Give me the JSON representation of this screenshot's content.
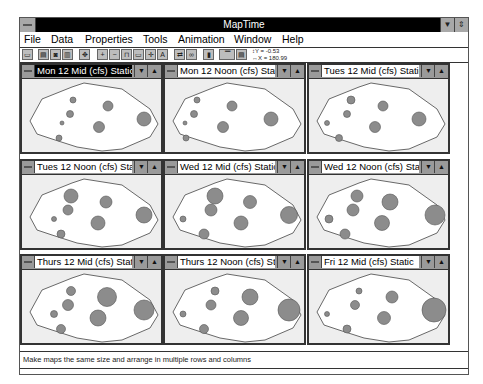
{
  "window": {
    "title": "MapTime",
    "sysmenu_icon": "system-menu-icon",
    "minimize_icon": "minimize-arrow-icon",
    "restore_icon": "restore-arrows-icon"
  },
  "menubar": {
    "items": [
      {
        "label": "File",
        "accel": "F"
      },
      {
        "label": "Data",
        "accel": "D"
      },
      {
        "label": "Properties",
        "accel": "P"
      },
      {
        "label": "Tools",
        "accel": "T"
      },
      {
        "label": "Animation",
        "accel": "A"
      },
      {
        "label": "Window",
        "accel": "W"
      },
      {
        "label": "Help",
        "accel": "H"
      }
    ]
  },
  "toolbar": {
    "buttons": [
      {
        "icon": "open-map-icon",
        "glyph": "▭"
      },
      {
        "icon": "table-icon",
        "glyph": "▤"
      },
      {
        "icon": "chart-icon",
        "glyph": "◙"
      },
      {
        "icon": "legend-icon",
        "glyph": "▥"
      },
      {
        "icon": "pan-icon",
        "glyph": "✥"
      },
      {
        "icon": "zoom-in-icon",
        "glyph": "+"
      },
      {
        "icon": "zoom-out-icon",
        "glyph": "−"
      },
      {
        "icon": "frame-icon",
        "glyph": "⊓"
      },
      {
        "icon": "rectangle-icon",
        "glyph": "▭"
      },
      {
        "icon": "move-icon",
        "glyph": "✛"
      },
      {
        "icon": "text-icon",
        "glyph": "A"
      },
      {
        "icon": "link-icon",
        "glyph": "⇄"
      },
      {
        "icon": "symbol-icon",
        "glyph": "∞"
      },
      {
        "icon": "vertical-bar-icon",
        "glyph": "▮"
      },
      {
        "icon": "window-icon",
        "glyph": "▔"
      },
      {
        "icon": "stack-icon",
        "glyph": "▤"
      }
    ],
    "coords": {
      "y": "↕Y = -0.53",
      "x": "↔X = 180.99"
    }
  },
  "maps": [
    {
      "title": "Mon 12 Mid (cfs) Static",
      "active": true,
      "circles": [
        [
          40,
          44,
          2
        ],
        [
          51,
          21,
          3
        ],
        [
          48,
          35,
          3.5
        ],
        [
          86,
          27,
          5
        ],
        [
          77,
          48,
          5.5
        ],
        [
          122,
          40,
          7
        ],
        [
          37,
          59,
          3
        ]
      ]
    },
    {
      "title": "Mon 12 Noon (cfs) Static",
      "active": false,
      "circles": [
        [
          20,
          44,
          2
        ],
        [
          32,
          21,
          3
        ],
        [
          29,
          35,
          3.5
        ],
        [
          67,
          27,
          5
        ],
        [
          58,
          48,
          5.5
        ],
        [
          106,
          40,
          7
        ],
        [
          21,
          59,
          3
        ]
      ]
    },
    {
      "title": "Tues 12 Mid (cfs) Static",
      "active": false,
      "circles": [
        [
          18,
          44,
          2.5
        ],
        [
          42,
          21,
          4
        ],
        [
          38,
          35,
          3.5
        ],
        [
          74,
          27,
          5
        ],
        [
          66,
          48,
          5.5
        ],
        [
          110,
          40,
          7
        ],
        [
          30,
          59,
          3.5
        ]
      ]
    },
    {
      "title": "Tues 12 Noon (cfs) Static",
      "active": false,
      "circles": [
        [
          32,
          44,
          2.5
        ],
        [
          49,
          21,
          7
        ],
        [
          46,
          35,
          5
        ],
        [
          84,
          27,
          6
        ],
        [
          76,
          48,
          7
        ],
        [
          122,
          40,
          8
        ],
        [
          39,
          59,
          4
        ]
      ]
    },
    {
      "title": "Wed 12 Mid (cfs) Static",
      "active": false,
      "circles": [
        [
          18,
          44,
          3
        ],
        [
          50,
          21,
          8
        ],
        [
          46,
          35,
          6
        ],
        [
          85,
          27,
          6.5
        ],
        [
          76,
          48,
          7
        ],
        [
          124,
          40,
          8.5
        ],
        [
          39,
          59,
          5
        ]
      ]
    },
    {
      "title": "Wed 12 Noon (cfs) Static",
      "active": false,
      "circles": [
        [
          20,
          44,
          4
        ],
        [
          48,
          21,
          6
        ],
        [
          44,
          35,
          6
        ],
        [
          81,
          27,
          8
        ],
        [
          73,
          48,
          7.5
        ],
        [
          126,
          40,
          10
        ],
        [
          36,
          59,
          5
        ]
      ]
    },
    {
      "title": "Thurs 12 Mid (cfs) Static",
      "active": false,
      "circles": [
        [
          32,
          44,
          3.5
        ],
        [
          49,
          21,
          4.5
        ],
        [
          46,
          35,
          5.5
        ],
        [
          85,
          27,
          9.5
        ],
        [
          76,
          48,
          8
        ],
        [
          122,
          40,
          10
        ],
        [
          39,
          59,
          4.5
        ]
      ]
    },
    {
      "title": "Thurs 12 Noon (cfs) Static",
      "active": false,
      "circles": [
        [
          18,
          44,
          3
        ],
        [
          50,
          21,
          4
        ],
        [
          46,
          35,
          5
        ],
        [
          85,
          27,
          8
        ],
        [
          76,
          48,
          7.5
        ],
        [
          124,
          40,
          11
        ],
        [
          39,
          59,
          4.5
        ]
      ]
    },
    {
      "title": "Fri 12 Mid (cfs) Static",
      "active": false,
      "circles": [
        [
          18,
          44,
          2.5
        ],
        [
          50,
          21,
          3
        ],
        [
          46,
          35,
          4.5
        ],
        [
          83,
          27,
          6
        ],
        [
          75,
          48,
          6.5
        ],
        [
          125,
          40,
          12
        ],
        [
          38,
          59,
          4
        ]
      ]
    }
  ],
  "colors": {
    "circle_fill": "#8c8c8c",
    "circle_stroke": "#555555",
    "outline": "#444444"
  },
  "statusbar": {
    "text": "Make maps the same size and arrange in multiple rows and columns"
  }
}
